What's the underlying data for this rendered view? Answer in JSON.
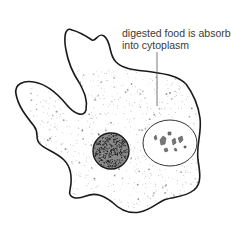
{
  "diagram": {
    "annotations": [
      {
        "id": "food-absorbed",
        "lines": [
          "digested food is absorbed",
          "into cytoplasm"
        ],
        "points_to": "cytoplasm"
      }
    ],
    "parts": [
      "cell-membrane",
      "cytoplasm",
      "nucleus",
      "food-vacuole",
      "pseudopodia"
    ],
    "colors": {
      "outline": "#1a1a1a",
      "stipple": "#6f6f6f",
      "nucleus": "#2a2a2a",
      "text": "#3a3a3a",
      "background": "#ffffff"
    }
  }
}
